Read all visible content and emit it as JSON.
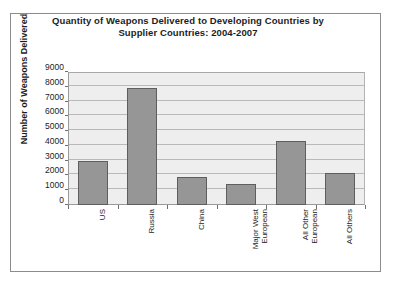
{
  "chart_data": {
    "type": "bar",
    "title": "Quantity of Weapons Delivered to Developing Countries by Supplier Countries: 2004-2007",
    "title_line1": "Quantity of Weapons Delivered to Developing Countries by",
    "title_line2": "Supplier Countries: 2004-2007",
    "xlabel": "",
    "ylabel": "Number of Weapons Delivered",
    "ylim": [
      0,
      9000
    ],
    "ytick_step": 1000,
    "grid": true,
    "legend": false,
    "categories": [
      "US",
      "Russia",
      "China",
      "Major West European",
      "All Other European",
      "All Others"
    ],
    "category_lines": [
      [
        "US"
      ],
      [
        "Russia"
      ],
      [
        "China"
      ],
      [
        "Major West",
        "European"
      ],
      [
        "All Other",
        "European"
      ],
      [
        "All Others"
      ]
    ],
    "values": [
      3000,
      7900,
      1900,
      1400,
      4300,
      2200
    ],
    "yticks": [
      "0",
      "1000",
      "2000",
      "3000",
      "4000",
      "5000",
      "6000",
      "7000",
      "8000",
      "9000"
    ],
    "ytick_values": [
      0,
      1000,
      2000,
      3000,
      4000,
      5000,
      6000,
      7000,
      8000,
      9000
    ],
    "colors": {
      "bar_fill": "#969696",
      "bar_border": "#5e5e5e",
      "plot_background": "#eeeeee",
      "gridline": "#b9b9b9",
      "axis": "#6e6e6e",
      "text": "#1d1d1d",
      "page_background": "#ffffff",
      "frame_border": "#8c8c8c"
    }
  }
}
